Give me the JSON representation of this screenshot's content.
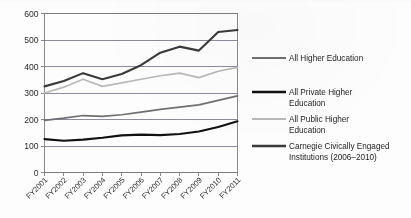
{
  "chart_data": {
    "type": "line",
    "title": "",
    "xlabel": "",
    "ylabel": "",
    "categories": [
      "FY2001",
      "FY2002",
      "FY2003",
      "FY2004",
      "FY2005",
      "FY2006",
      "FY2007",
      "FY2008",
      "FY2009",
      "FY2010",
      "FY2011"
    ],
    "ylim": [
      0,
      600
    ],
    "yticks": [
      0,
      100,
      200,
      300,
      400,
      500,
      600
    ],
    "ytick_labels": [
      "0",
      "100",
      "200",
      "300",
      "400",
      "500",
      "600"
    ],
    "grid": true,
    "legend_position": "right",
    "series": [
      {
        "name": "All Higher Education",
        "color": "#6f6f6f",
        "values": [
          197,
          205,
          215,
          212,
          218,
          228,
          238,
          247,
          255,
          272,
          289
        ]
      },
      {
        "name": "All Private Higher Education",
        "color": "#111111",
        "values": [
          126,
          120,
          124,
          131,
          140,
          143,
          141,
          145,
          155,
          172,
          193
        ]
      },
      {
        "name": "All Public Higher Education",
        "color": "#b9b9b9",
        "values": [
          300,
          322,
          352,
          325,
          338,
          352,
          365,
          375,
          358,
          382,
          397
        ]
      },
      {
        "name": "Carnegie Civically Engaged Institutions (2006–2010)",
        "color": "#3a3a3a",
        "values": [
          325,
          345,
          375,
          352,
          372,
          405,
          452,
          475,
          460,
          530,
          538
        ]
      }
    ]
  },
  "legend": {
    "entries": [
      {
        "label": "All Higher Education",
        "lines": [
          "All Higher Education"
        ]
      },
      {
        "label": "All Private Higher Education",
        "lines": [
          "All Private Higher",
          "Education"
        ]
      },
      {
        "label": "All Public Higher Education",
        "lines": [
          "All Public Higher",
          "Education"
        ]
      },
      {
        "label": "Carnegie Civically Engaged Institutions (2006–2010)",
        "lines": [
          "Carnegie Civically Engaged",
          "Institutions (2006–2010)"
        ]
      }
    ]
  },
  "colors": {
    "plot_border": "#7b7b7b",
    "gridline": "#6e6e84",
    "background": "#fdfdfd",
    "text": "#1c1c1c"
  }
}
